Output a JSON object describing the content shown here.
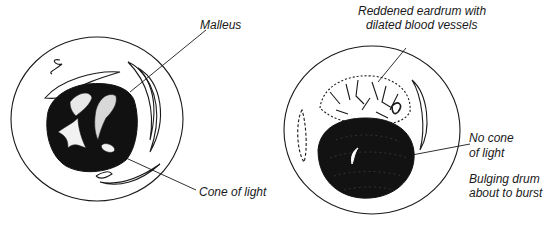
{
  "diagram": {
    "left_panel": {
      "subject": "normal-eardrum",
      "labels": {
        "malleus": "Malleus",
        "cone_of_light": "Cone of light"
      }
    },
    "right_panel": {
      "subject": "infected-eardrum",
      "labels": {
        "reddened_line1": "Reddened eardrum with",
        "reddened_line2": "dilated blood vessels",
        "no_cone_line1": "No cone",
        "no_cone_line2": "of light",
        "bulging_line1": "Bulging drum",
        "bulging_line2": "about to burst"
      }
    },
    "colors": {
      "ink": "#1a1a1a",
      "background": "#ffffff",
      "highlight": "#d8d8d8"
    }
  }
}
